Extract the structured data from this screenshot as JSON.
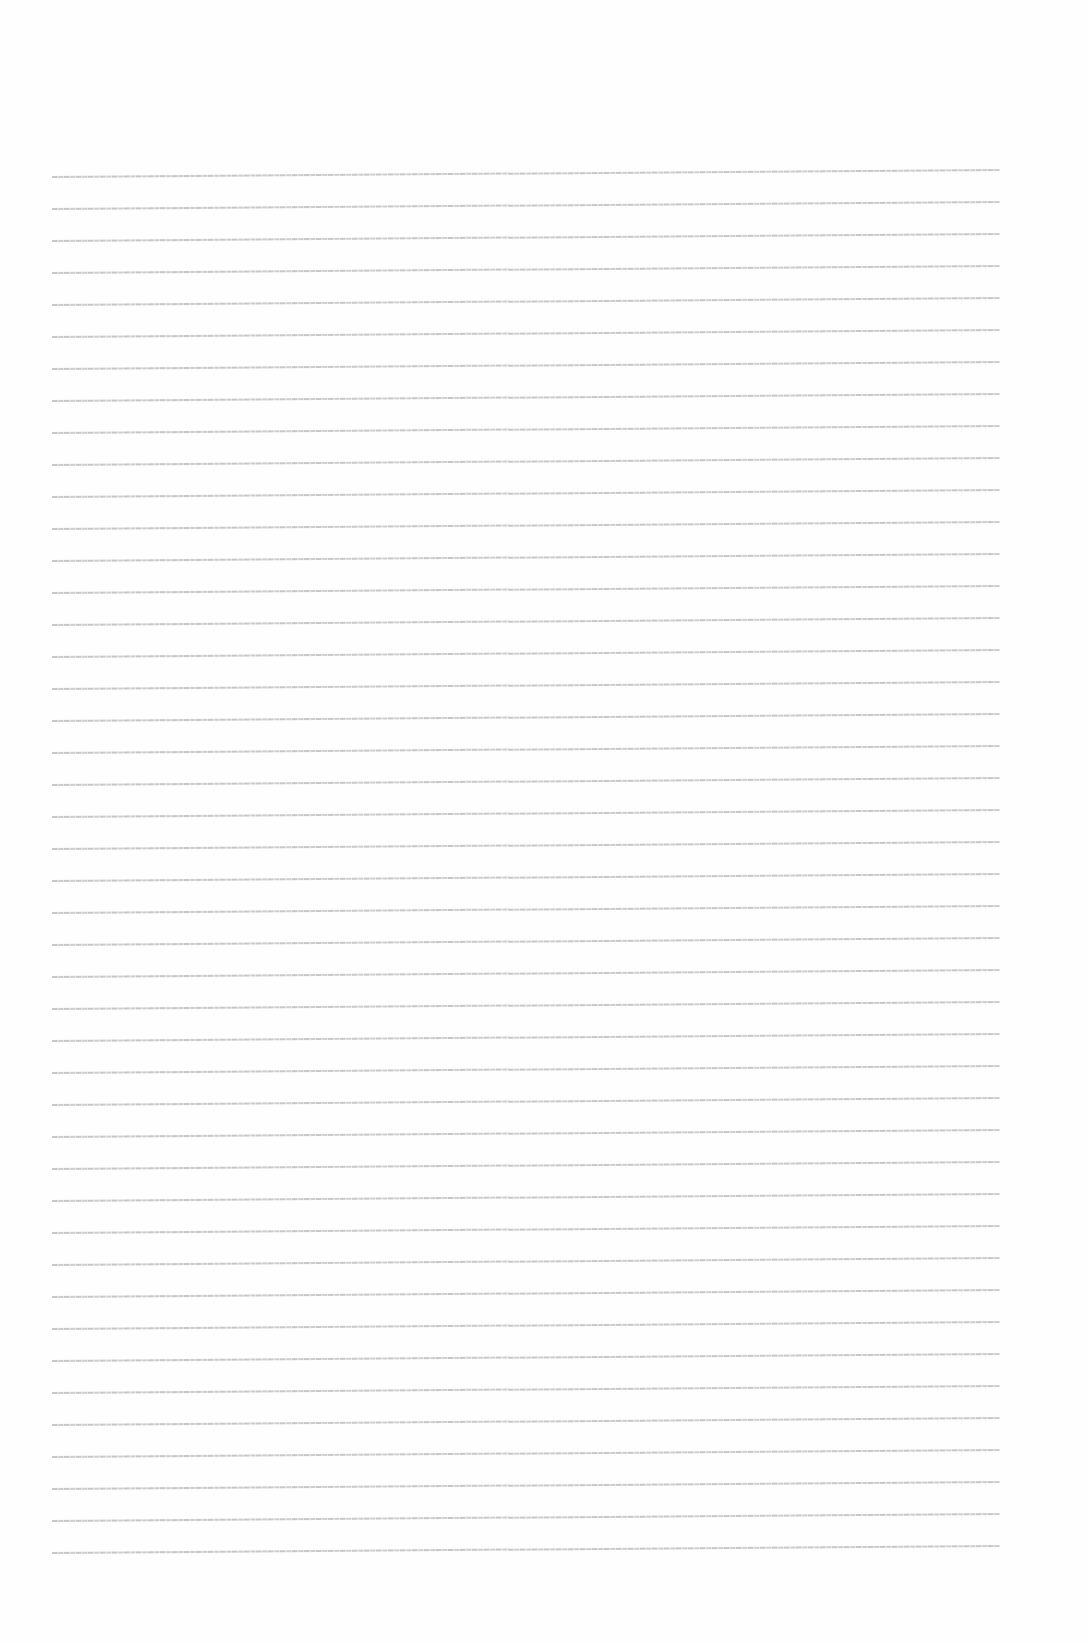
{
  "document": {
    "type": "blank lined writing page",
    "background_color": "#fefefe",
    "rule_color": "#c4c4c4",
    "rule_count": 44,
    "rule_spacing_px": 32,
    "rule_left_px": 52,
    "rule_right_px": 1000,
    "first_rule_y_left_px": 177,
    "tilt_px_over_width": -7,
    "text_content": ""
  }
}
